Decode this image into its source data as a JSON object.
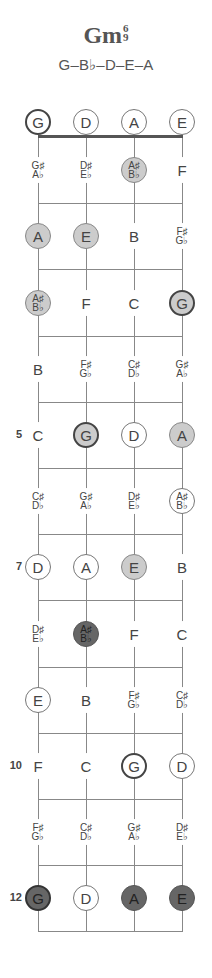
{
  "chord": {
    "name": "Gm",
    "sup_top": "6",
    "sup_bottom": "9",
    "notes_formula": "G–B♭–D–E–A"
  },
  "strings": [
    "G",
    "D",
    "A",
    "E"
  ],
  "fret_numbers": [
    {
      "fret": 5,
      "label": "5"
    },
    {
      "fret": 7,
      "label": "7"
    },
    {
      "fret": 10,
      "label": "10"
    },
    {
      "fret": 12,
      "label": "12"
    }
  ],
  "rows": [
    {
      "fret": 0,
      "cells": [
        {
          "t": "G",
          "style": "open root"
        },
        {
          "t": "D",
          "style": "open"
        },
        {
          "t": "A",
          "style": "open"
        },
        {
          "t": "E",
          "style": "open"
        }
      ]
    },
    {
      "fret": 1,
      "cells": [
        {
          "t": "G♯",
          "b": "A♭",
          "style": "plain"
        },
        {
          "t": "D♯",
          "b": "E♭",
          "style": "plain"
        },
        {
          "t": "A♯",
          "b": "B♭",
          "style": "fill"
        },
        {
          "t": "F",
          "style": "plain"
        }
      ]
    },
    {
      "fret": 2,
      "cells": [
        {
          "t": "A",
          "style": "fill"
        },
        {
          "t": "E",
          "style": "fill"
        },
        {
          "t": "B",
          "style": "plain"
        },
        {
          "t": "F♯",
          "b": "G♭",
          "style": "plain"
        }
      ]
    },
    {
      "fret": 3,
      "cells": [
        {
          "t": "A♯",
          "b": "B♭",
          "style": "fill"
        },
        {
          "t": "F",
          "style": "plain"
        },
        {
          "t": "C",
          "style": "plain"
        },
        {
          "t": "G",
          "style": "fill root"
        }
      ]
    },
    {
      "fret": 4,
      "cells": [
        {
          "t": "B",
          "style": "plain"
        },
        {
          "t": "F♯",
          "b": "G♭",
          "style": "plain"
        },
        {
          "t": "C♯",
          "b": "D♭",
          "style": "plain"
        },
        {
          "t": "G♯",
          "b": "A♭",
          "style": "plain"
        }
      ]
    },
    {
      "fret": 5,
      "cells": [
        {
          "t": "C",
          "style": "plain"
        },
        {
          "t": "G",
          "style": "fill root"
        },
        {
          "t": "D",
          "style": "open"
        },
        {
          "t": "A",
          "style": "fill"
        }
      ]
    },
    {
      "fret": 6,
      "cells": [
        {
          "t": "C♯",
          "b": "D♭",
          "style": "plain"
        },
        {
          "t": "G♯",
          "b": "A♭",
          "style": "plain"
        },
        {
          "t": "D♯",
          "b": "E♭",
          "style": "plain"
        },
        {
          "t": "A♯",
          "b": "B♭",
          "style": "open"
        }
      ]
    },
    {
      "fret": 7,
      "cells": [
        {
          "t": "D",
          "style": "open"
        },
        {
          "t": "A",
          "style": "open"
        },
        {
          "t": "E",
          "style": "fill"
        },
        {
          "t": "B",
          "style": "plain"
        }
      ]
    },
    {
      "fret": 8,
      "cells": [
        {
          "t": "D♯",
          "b": "E♭",
          "style": "plain"
        },
        {
          "t": "A♯",
          "b": "B♭",
          "style": "dark"
        },
        {
          "t": "F",
          "style": "plain"
        },
        {
          "t": "C",
          "style": "plain"
        }
      ]
    },
    {
      "fret": 9,
      "cells": [
        {
          "t": "E",
          "style": "open"
        },
        {
          "t": "B",
          "style": "plain"
        },
        {
          "t": "F♯",
          "b": "G♭",
          "style": "plain"
        },
        {
          "t": "C♯",
          "b": "D♭",
          "style": "plain"
        }
      ]
    },
    {
      "fret": 10,
      "cells": [
        {
          "t": "F",
          "style": "plain"
        },
        {
          "t": "C",
          "style": "plain"
        },
        {
          "t": "G",
          "style": "open root"
        },
        {
          "t": "D",
          "style": "open"
        }
      ]
    },
    {
      "fret": 11,
      "cells": [
        {
          "t": "F♯",
          "b": "G♭",
          "style": "plain"
        },
        {
          "t": "C♯",
          "b": "D♭",
          "style": "plain"
        },
        {
          "t": "G♯",
          "b": "A♭",
          "style": "plain"
        },
        {
          "t": "D♯",
          "b": "E♭",
          "style": "plain"
        }
      ]
    },
    {
      "fret": 12,
      "cells": [
        {
          "t": "G",
          "style": "dark root"
        },
        {
          "t": "D",
          "style": "open"
        },
        {
          "t": "A",
          "style": "dark"
        },
        {
          "t": "E",
          "style": "dark"
        }
      ]
    }
  ],
  "colors": {
    "fill_light": "#cccccc",
    "fill_dark": "#666666",
    "line": "#888888",
    "nut": "#555555"
  }
}
